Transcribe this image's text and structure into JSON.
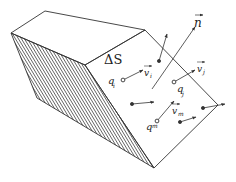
{
  "figure": {
    "surface_label": "ΔS",
    "normal_label": "n",
    "colors": {
      "ink": "#333333",
      "background": "#ffffff"
    }
  },
  "labels": {
    "q_i": "q",
    "q_i_sub": "i",
    "v_i": "v",
    "v_i_sub": "i",
    "q_j": "q",
    "q_j_sub": "j",
    "v_j": "v",
    "v_j_sub": "j",
    "q_m": "q",
    "q_m_sub": "m",
    "v_m": "v",
    "v_m_sub": "m"
  },
  "particles": [
    {
      "id": "i",
      "x": 123,
      "y": 80,
      "vx": 143,
      "vy": 70,
      "labeled": true
    },
    {
      "id": "j",
      "x": 174,
      "y": 82,
      "vx": 195,
      "vy": 70,
      "labeled": true
    },
    {
      "id": "m",
      "x": 157,
      "y": 121,
      "vx": 174,
      "vy": 101,
      "labeled": true
    },
    {
      "id": "p1",
      "x": 159,
      "y": 61,
      "vx": 167,
      "vy": 34,
      "labeled": false
    },
    {
      "id": "p2",
      "x": 132,
      "y": 104,
      "vx": 154,
      "vy": 102,
      "labeled": false
    },
    {
      "id": "p3",
      "x": 180,
      "y": 122,
      "vx": 196,
      "vy": 117,
      "labeled": false
    },
    {
      "id": "p4",
      "x": 203,
      "y": 108,
      "vx": 225,
      "vy": 104,
      "labeled": false
    }
  ]
}
